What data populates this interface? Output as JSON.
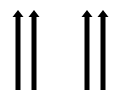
{
  "diagram": {
    "color": "#000000",
    "arrows": [
      {
        "cx": 18,
        "direction": "up",
        "group": 1
      },
      {
        "cx": 34,
        "direction": "up",
        "group": 1
      },
      {
        "cx": 87,
        "direction": "up",
        "group": 2
      },
      {
        "cx": 103,
        "direction": "up",
        "group": 2
      }
    ]
  }
}
